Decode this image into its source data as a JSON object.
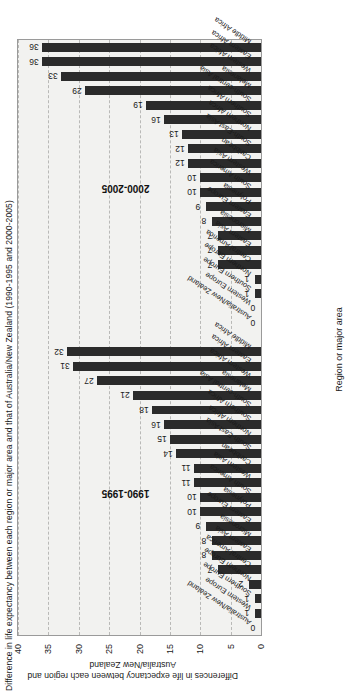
{
  "title": "Difference in life expectancy between each region or major area and that of Australia/New Zealand (1990-1995 and 2000-2005)",
  "axes": {
    "xlabel": "Region or major area",
    "ylabel": "Differences in life expectancy between each region and Australia/New Zealand",
    "yticks": [
      "0",
      "5",
      "10",
      "15",
      "20",
      "25",
      "30",
      "35",
      "40"
    ]
  },
  "groups": [
    {
      "label": "1990-1995"
    },
    {
      "label": "2000-2005"
    }
  ],
  "chart_data": {
    "type": "bar",
    "title": "Difference in life expectancy between each region or major area and that of Australia/New Zealand (1990-1995 and 2000-2005)",
    "xlabel": "Region or major area",
    "ylabel": "Differences in life expectancy between each region and Australia/New Zealand",
    "ylim": [
      0,
      40
    ],
    "ytick_step": 5,
    "grid": true,
    "legend": "none",
    "panels": [
      {
        "name": "1990-1995",
        "categories": [
          "Australia/New Zealand",
          "Western Europe",
          "Southern Europe",
          "Northern Europe",
          "Central America",
          "Eastern Asia",
          "Micronesia",
          "Eastern Europe",
          "Polynesia",
          "South America",
          "Western Asia",
          "Caribbean",
          "South-East Asia",
          "Northern Africa",
          "Southern Africa",
          "South-central Asia",
          "Melanesia",
          "Western Africa",
          "Eastern Africa",
          "Middle Africa"
        ],
        "values": [
          0,
          1,
          1,
          2,
          7,
          8,
          8,
          9,
          10,
          10,
          11,
          11,
          14,
          15,
          16,
          18,
          21,
          27,
          31,
          32
        ]
      },
      {
        "name": "2000-2005",
        "categories": [
          "Australia/New Zealand",
          "Western Europe",
          "Southern Europe",
          "Northern Europe",
          "Central America",
          "Eastern Asia",
          "Micronesia",
          "Eastern Europe",
          "Polynesia",
          "South America",
          "Western Asia",
          "Caribbean",
          "South-East Asia",
          "Northern Africa",
          "Southern Africa",
          "South-central Asia",
          "Melanesia",
          "Western Africa",
          "Eastern Africa",
          "Middle Africa"
        ],
        "values": [
          0,
          0,
          1,
          1,
          7,
          7,
          7,
          8,
          9,
          10,
          10,
          12,
          12,
          13,
          16,
          19,
          29,
          33,
          36,
          36
        ]
      }
    ]
  }
}
